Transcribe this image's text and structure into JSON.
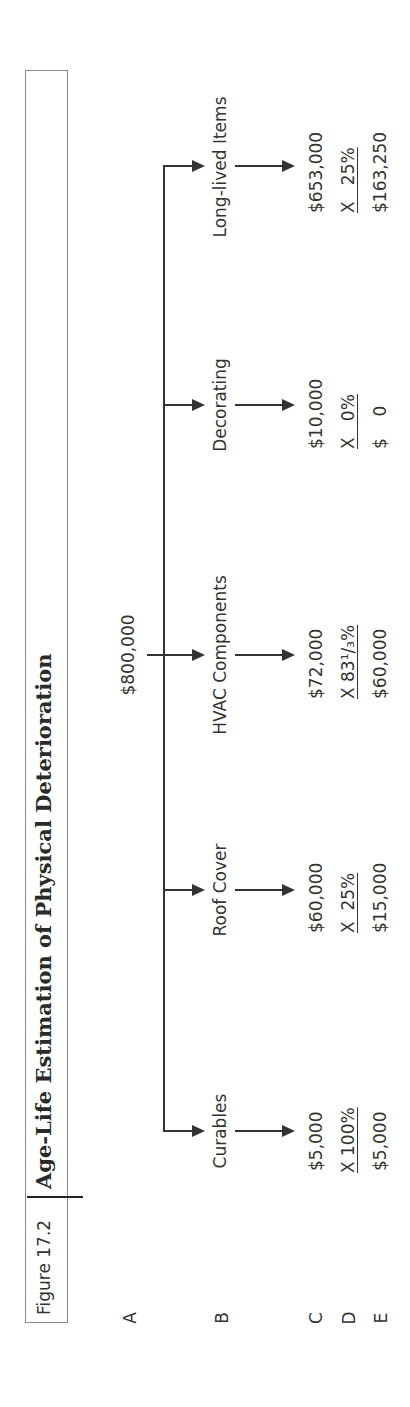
{
  "figure": {
    "label": "Figure 17.2",
    "title": "Age-Life Estimation of Physical Deterioration"
  },
  "rows": [
    "A",
    "B",
    "C",
    "D",
    "E"
  ],
  "total": "$800,000",
  "components": [
    {
      "name": "Curables",
      "cost": "$5,000",
      "multiplier": "X 100%",
      "result": "$5,000"
    },
    {
      "name": "Roof Cover",
      "cost": "$60,000",
      "multiplier": "X  25%",
      "result": "$15,000"
    },
    {
      "name": "HVAC Components",
      "cost": "$72,000",
      "multiplier": "X 83¹/₃%",
      "result": "$60,000"
    },
    {
      "name": "Decorating",
      "cost": "$10,000",
      "multiplier": "X   0%",
      "result": "$    0"
    },
    {
      "name": "Long-lived Items",
      "cost": "$653,000",
      "multiplier": "X   25%",
      "result": "$163,250"
    }
  ]
}
